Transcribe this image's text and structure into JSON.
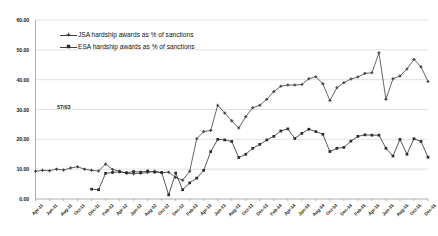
{
  "chart_data": {
    "type": "line",
    "title": "",
    "xlabel": "",
    "ylabel": "",
    "ylim": [
      0,
      60
    ],
    "ytick_step": 10,
    "ytick_labels": [
      "0.00",
      "10.00",
      "20.00",
      "30.00",
      "40.00",
      "50.00",
      "60.00"
    ],
    "grid": true,
    "legend_position": "top-left-inside",
    "annotations": [
      {
        "text": "57/03",
        "x_frac": 0.055,
        "value": 31.0
      }
    ],
    "x": [
      "Apr-11",
      "May-11",
      "Jun-11",
      "Jul-11",
      "Aug-11",
      "Sep-11",
      "Oct-11",
      "Nov-11",
      "Dec-11",
      "Jan-12",
      "Feb-12",
      "Mar-12",
      "Apr-12",
      "May-12",
      "Jun-12",
      "Jul-12",
      "Aug-12",
      "Sep-12",
      "Oct-12",
      "Nov-12",
      "Dec-12",
      "Jan-13",
      "Feb-13",
      "Mar-13",
      "Apr-13",
      "May-13",
      "Jun-13",
      "Jul-13",
      "Aug-13",
      "Sep-13",
      "Oct-13",
      "Nov-13",
      "Dec-13",
      "Jan-14",
      "Feb-14",
      "Mar-14",
      "Apr-14",
      "May-14",
      "Jun-14",
      "Jul-14",
      "Aug-14",
      "Sep-14",
      "Oct-14",
      "Nov-14",
      "Dec-14",
      "Jan-15",
      "Feb-15",
      "Mar-15",
      "Apr-15",
      "May-15",
      "Jun-15",
      "Jul-15",
      "Aug-15",
      "Sep-15",
      "Oct-15",
      "Nov-15",
      "Dec-15"
    ],
    "xtick_labels": [
      "Apr-11",
      "Jun-11",
      "Aug-11",
      "Oct-11",
      "Dec-11",
      "Feb-12",
      "Apr-12",
      "Jun-12",
      "Aug-12",
      "Oct-12",
      "Dec-12",
      "Feb-13",
      "Apr-13",
      "Jun-13",
      "Aug-13",
      "Oct-13",
      "Dec-13",
      "Feb-14",
      "Apr-14",
      "Jun-14",
      "Aug-14",
      "Oct-14",
      "Dec-14",
      "Feb-15",
      "Apr-15",
      "Jun-15",
      "Aug-15",
      "Oct-15",
      "Dec-15"
    ],
    "xtick_every": 2,
    "series": [
      {
        "name": "JSA hardship awards as % of sanctions",
        "marker": "cross",
        "color": "#3f3f3f",
        "values": [
          9.3,
          9.6,
          9.5,
          10.0,
          9.7,
          10.4,
          10.8,
          10.0,
          9.6,
          9.4,
          11.7,
          9.9,
          9.3,
          8.6,
          8.5,
          8.6,
          8.9,
          9.3,
          8.8,
          9.0,
          7.2,
          6.3,
          9.3,
          20.2,
          22.6,
          23.0,
          31.4,
          28.8,
          26.2,
          23.8,
          27.6,
          30.6,
          31.4,
          33.4,
          36.0,
          37.8,
          38.2,
          38.2,
          38.4,
          40.3,
          41.0,
          38.6,
          33.0,
          37.3,
          39.0,
          40.2,
          40.9,
          42.1,
          42.3,
          49.0,
          33.4,
          40.3,
          41.2,
          43.6,
          46.8,
          44.3,
          39.4
        ]
      },
      {
        "name": "ESA hardship awards as % of sanctions",
        "marker": "square",
        "color": "#2b2b2b",
        "values": [
          null,
          null,
          null,
          null,
          null,
          null,
          null,
          null,
          3.3,
          3.1,
          8.6,
          8.9,
          9.1,
          8.8,
          9.2,
          9.0,
          9.4,
          9.0,
          8.9,
          1.4,
          8.7,
          3.1,
          5.4,
          7.0,
          9.6,
          15.9,
          20.0,
          19.8,
          19.3,
          13.9,
          15.0,
          17.0,
          18.3,
          19.8,
          21.0,
          22.8,
          23.5,
          20.3,
          22.0,
          23.4,
          22.6,
          21.7,
          15.9,
          17.0,
          17.3,
          19.4,
          21.0,
          21.5,
          21.4,
          21.4,
          17.0,
          14.4,
          20.0,
          15.0,
          20.2,
          19.3,
          14.0
        ]
      }
    ]
  },
  "legend": {
    "items": [
      {
        "label": "JSA hardship awards as % of sanctions",
        "marker": "cross"
      },
      {
        "label": "ESA hardship awards as % of sanctions",
        "marker": "square"
      }
    ]
  }
}
